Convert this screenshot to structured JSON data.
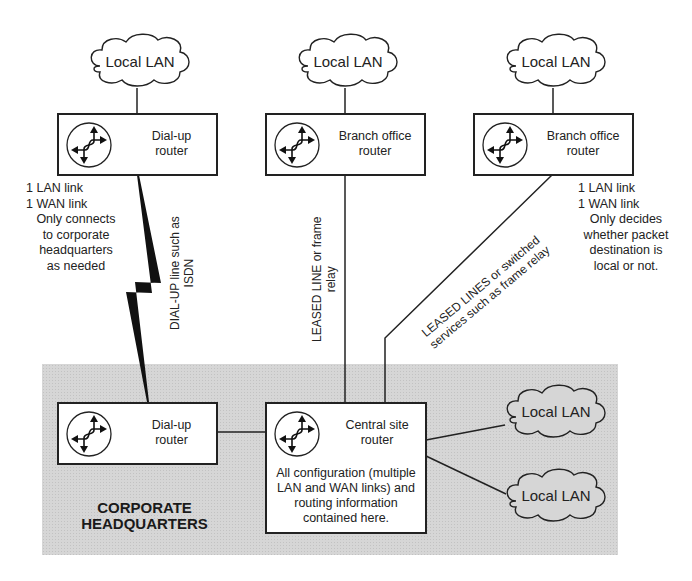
{
  "diagram": {
    "type": "network-topology",
    "region": {
      "label_line1": "CORPORATE",
      "label_line2": "HEADQUARTERS",
      "fill": "#d6d6d6"
    },
    "clouds": {
      "top_left": "Local LAN",
      "top_middle": "Local LAN",
      "top_right": "Local LAN",
      "hq_upper": "Local LAN",
      "hq_lower": "Local LAN"
    },
    "routers": {
      "remote_dialup": {
        "line1": "Dial-up",
        "line2": "router"
      },
      "branch_middle": {
        "line1": "Branch office",
        "line2": "router"
      },
      "branch_right": {
        "line1": "Branch office",
        "line2": "router"
      },
      "hq_dialup": {
        "line1": "Dial-up",
        "line2": "router"
      },
      "central": {
        "line1": "Central site",
        "line2": "router",
        "desc1": "All configuration (multiple",
        "desc2": "LAN and WAN links) and",
        "desc3": "routing information",
        "desc4": "contained here."
      }
    },
    "notes": {
      "left": {
        "l1": "1 LAN link",
        "l2": "1 WAN link",
        "l3": "Only connects",
        "l4": "to corporate",
        "l5": "headquarters",
        "l6": "as needed"
      },
      "right": {
        "l1": "1 LAN link",
        "l2": "1 WAN link",
        "l3": "Only decides",
        "l4": "whether packet",
        "l5": "destination is",
        "l6": "local or not."
      }
    },
    "links": {
      "dialup": {
        "l1": "DIAL-UP line such as",
        "l2": "ISDN"
      },
      "leased": {
        "l1": "LEASED  LINE or frame",
        "l2": "relay"
      },
      "switched": {
        "l1": "LEASED LINES or switched",
        "l2": "services such as frame relay"
      }
    },
    "icon_names": [
      "router-icon",
      "cloud-icon",
      "lightning-bolt-icon"
    ]
  }
}
